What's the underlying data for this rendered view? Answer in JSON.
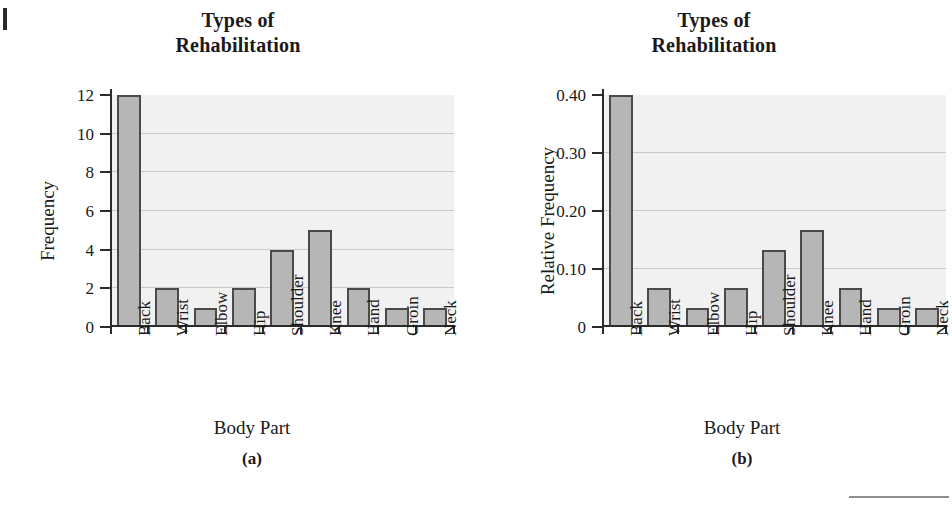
{
  "figures": [
    {
      "id": "a",
      "title_line1": "Types of",
      "title_line2": "Rehabilitation",
      "caption": "(a)",
      "xlabel": "Body Part",
      "ylabel": "Frequency",
      "ytick_labels": [
        "0",
        "2",
        "4",
        "6",
        "8",
        "10",
        "12"
      ]
    },
    {
      "id": "b",
      "title_line1": "Types of",
      "title_line2": "Rehabilitation",
      "caption": "(b)",
      "xlabel": "Body Part",
      "ylabel": "Relative Frequency",
      "ytick_labels": [
        "0",
        "0.10",
        "0.20",
        "0.30",
        "0.40"
      ]
    }
  ],
  "chart_data": [
    {
      "type": "bar",
      "title": "Types of Rehabilitation",
      "subtitle": "(a)",
      "xlabel": "Body Part",
      "ylabel": "Frequency",
      "categories": [
        "Back",
        "Wrist",
        "Elbow",
        "Hip",
        "Shoulder",
        "Knee",
        "Hand",
        "Groin",
        "Neck"
      ],
      "values": [
        12,
        2,
        1,
        2,
        4,
        5,
        2,
        1,
        1
      ],
      "ylim": [
        0,
        12
      ],
      "yticks": [
        0,
        2,
        4,
        6,
        8,
        10,
        12
      ],
      "grid": true,
      "legend": "none",
      "bar_fill": "#b6b6b6",
      "bar_stroke": "#4a4a4a",
      "plot_background": "#f1f1f1"
    },
    {
      "type": "bar",
      "title": "Types of Rehabilitation",
      "subtitle": "(b)",
      "xlabel": "Body Part",
      "ylabel": "Relative Frequency",
      "categories": [
        "Back",
        "Wrist",
        "Elbow",
        "Hip",
        "Shoulder",
        "Knee",
        "Hand",
        "Groin",
        "Neck"
      ],
      "values": [
        0.4,
        0.067,
        0.033,
        0.067,
        0.133,
        0.167,
        0.067,
        0.033,
        0.033
      ],
      "ylim": [
        0,
        0.4
      ],
      "yticks": [
        0,
        0.1,
        0.2,
        0.3,
        0.4
      ],
      "grid": true,
      "legend": "none",
      "bar_fill": "#b6b6b6",
      "bar_stroke": "#4a4a4a",
      "plot_background": "#f1f1f1"
    }
  ]
}
